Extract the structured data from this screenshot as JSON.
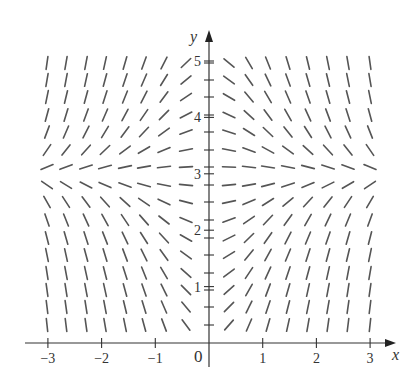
{
  "chart_data": {
    "type": "slope_field",
    "title": "",
    "xlabel": "x",
    "ylabel": "y",
    "xlim": [
      -3,
      3
    ],
    "ylim": [
      0,
      5
    ],
    "x_ticks": [
      -3,
      -2,
      -1,
      1,
      2,
      3
    ],
    "x_tick_labels": [
      "−3",
      "−2",
      "−1",
      "1",
      "2",
      "3"
    ],
    "y_ticks": [
      1,
      2,
      3,
      4,
      5
    ],
    "y_tick_labels": [
      "1",
      "2",
      "3",
      "4",
      "5"
    ],
    "origin_label": "0",
    "equilibrium_y": 3,
    "slope_description": "slope proportional to x(3 - y): horizontal along y = 3 and along x = 0; rising in upper-left and lower-right, falling in upper-right and lower-left",
    "grid_x_pixels": [
      47,
      66,
      86,
      105,
      125,
      144,
      164,
      186,
      229,
      249,
      268,
      288,
      308,
      328,
      348,
      370
    ],
    "grid_y_pixels": [
      63,
      80,
      97,
      115,
      132,
      150,
      167,
      185,
      202,
      220,
      238,
      255,
      273,
      290,
      307,
      325
    ],
    "grid": false,
    "legend": null
  },
  "axes": {
    "x_label": "x",
    "y_label": "y",
    "origin": "0"
  }
}
